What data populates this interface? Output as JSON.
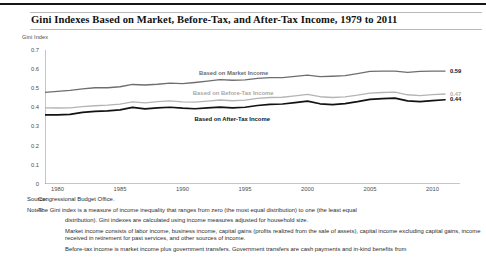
{
  "figure": {
    "title": "Gini Indexes Based on Market, Before-Tax, and After-Tax Income, 1979 to 2011",
    "source_key": "Source:",
    "source_value": "Congressional Budget Office.",
    "notes_key": "Notes:",
    "notes_paragraph_1": "The Gini index is a measure of income inequality that ranges from zero (the most equal distribution) to one (the least equal",
    "notes_paragraph_1b": "distribution). Gini indexes are calculated using income measures adjusted for household size.",
    "notes_paragraph_2": "Market income consists of labor income, business income, capital gains (profits realized from the sale of assets), capital income excluding capital gains, income received in retirement for past services, and other sources of income.",
    "notes_paragraph_3": "Before-tax income is market income plus government transfers. Government transfers are cash payments and in-kind benefits from"
  },
  "chart_data": {
    "type": "line",
    "title": "Gini Indexes Based on Market, Before-Tax, and After-Tax Income, 1979 to 2011",
    "xlabel": "",
    "ylabel": "Gini Index",
    "ylim": [
      0,
      0.7
    ],
    "xlim": [
      1979,
      2011
    ],
    "grid": false,
    "legend_position": "inline",
    "ytick_labels": [
      "0",
      "0.1",
      "0.2",
      "0.3",
      "0.4",
      "0.5",
      "0.6",
      "0.7"
    ],
    "ytick_values": [
      0,
      0.1,
      0.2,
      0.3,
      0.4,
      0.5,
      0.6,
      0.7
    ],
    "xtick_labels": [
      "1980",
      "1985",
      "1990",
      "1995",
      "2000",
      "2005",
      "2010"
    ],
    "xtick_values": [
      1980,
      1985,
      1990,
      1995,
      2000,
      2005,
      2010
    ],
    "x": [
      1979,
      1980,
      1981,
      1982,
      1983,
      1984,
      1985,
      1986,
      1987,
      1988,
      1989,
      1990,
      1991,
      1992,
      1993,
      1994,
      1995,
      1996,
      1997,
      1998,
      1999,
      2000,
      2001,
      2002,
      2003,
      2004,
      2005,
      2006,
      2007,
      2008,
      2009,
      2010,
      2011
    ],
    "series": [
      {
        "name": "Based on Market Income",
        "label": "Based on Market Income",
        "color": "#6e6e6e",
        "end_value": 0.59,
        "end_label": "0.59",
        "values": [
          0.479,
          0.484,
          0.489,
          0.497,
          0.503,
          0.503,
          0.508,
          0.52,
          0.517,
          0.521,
          0.527,
          0.524,
          0.53,
          0.537,
          0.545,
          0.542,
          0.544,
          0.552,
          0.556,
          0.556,
          0.562,
          0.569,
          0.561,
          0.563,
          0.566,
          0.577,
          0.588,
          0.59,
          0.59,
          0.583,
          0.588,
          0.59,
          0.59
        ]
      },
      {
        "name": "Based on Before-Tax Income",
        "label": "Based on Before-Tax Income",
        "color": "#b4b4b4",
        "end_value": 0.47,
        "end_label": "0.47",
        "values": [
          0.398,
          0.397,
          0.398,
          0.404,
          0.409,
          0.412,
          0.417,
          0.429,
          0.424,
          0.43,
          0.434,
          0.429,
          0.428,
          0.433,
          0.439,
          0.435,
          0.438,
          0.447,
          0.452,
          0.453,
          0.46,
          0.468,
          0.456,
          0.452,
          0.455,
          0.464,
          0.475,
          0.478,
          0.48,
          0.466,
          0.462,
          0.467,
          0.47
        ]
      },
      {
        "name": "Based on After-Tax Income",
        "label": "Based on After-Tax Income",
        "color": "#121212",
        "end_value": 0.44,
        "end_label": "0.44",
        "values": [
          0.361,
          0.361,
          0.364,
          0.374,
          0.379,
          0.382,
          0.387,
          0.4,
          0.392,
          0.398,
          0.401,
          0.396,
          0.393,
          0.398,
          0.402,
          0.398,
          0.401,
          0.41,
          0.416,
          0.418,
          0.425,
          0.433,
          0.419,
          0.415,
          0.42,
          0.43,
          0.442,
          0.446,
          0.449,
          0.434,
          0.43,
          0.436,
          0.44
        ]
      }
    ],
    "annotations": [
      {
        "text": "Based on Market Income",
        "x": 1994,
        "y": 0.575
      },
      {
        "text": "Based on Before-Tax Income",
        "x": 1994,
        "y": 0.472
      },
      {
        "text": "Based on After-Tax Income",
        "x": 1994,
        "y": 0.333
      }
    ]
  }
}
